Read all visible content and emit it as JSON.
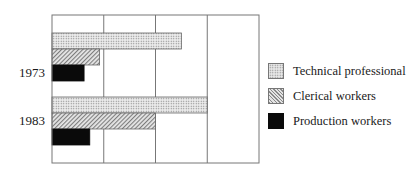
{
  "chart_data": {
    "type": "bar",
    "orientation": "horizontal",
    "title": "",
    "xlabel": "",
    "ylabel": "",
    "categories": [
      "1973",
      "1983"
    ],
    "series": [
      {
        "name": "Technical professional",
        "pattern": "dots",
        "values": [
          2.5,
          3.0
        ]
      },
      {
        "name": "Clerical workers",
        "pattern": "hatch",
        "values": [
          0.92,
          2.0
        ]
      },
      {
        "name": "Production workers",
        "pattern": "solid",
        "values": [
          0.62,
          0.73
        ]
      }
    ],
    "xlim": [
      0,
      4
    ],
    "x_ticks_labeled": false,
    "vertical_gridlines": [
      1,
      2,
      3
    ],
    "grid": true,
    "legend_position": "right",
    "colors": {
      "frame": "#777777",
      "grid": "#777777",
      "solid": "#0a0a0a",
      "pattern_fill": "#e8e8e8",
      "pattern_ink": "#8a8a8a"
    }
  },
  "legend": {
    "items": [
      {
        "label": "Technical professional"
      },
      {
        "label": "Clerical workers"
      },
      {
        "label": "Production workers"
      }
    ]
  },
  "axis": {
    "category_labels": [
      "1973",
      "1983"
    ]
  }
}
